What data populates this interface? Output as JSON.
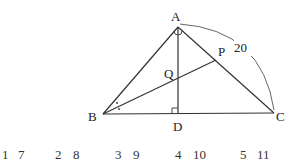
{
  "figure": {
    "points": {
      "A": {
        "label": "A",
        "x": 178,
        "y": 27
      },
      "B": {
        "label": "B",
        "x": 103,
        "y": 114
      },
      "C": {
        "label": "C",
        "x": 274,
        "y": 113
      },
      "D": {
        "label": "D",
        "x": 178,
        "y": 114
      },
      "P": {
        "label": "P",
        "x": 216,
        "y": 60
      },
      "Q": {
        "label": "Q",
        "x": 178,
        "y": 77
      }
    },
    "arc_label": "20",
    "line_color": "#333333"
  },
  "answer_choices": [
    {
      "number": "1",
      "value": "7"
    },
    {
      "number": "2",
      "value": "8"
    },
    {
      "number": "3",
      "value": "9"
    },
    {
      "number": "4",
      "value": "10"
    },
    {
      "number": "5",
      "value": "11"
    }
  ]
}
